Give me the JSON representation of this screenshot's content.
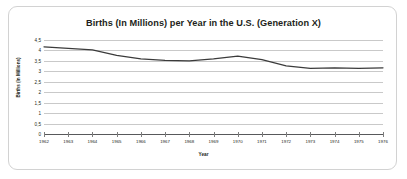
{
  "chart_data": {
    "type": "line",
    "title": "Births (In Millions) per Year in the U.S. (Generation X)",
    "xlabel": "Year",
    "ylabel": "Births (In Millions)",
    "categories": [
      1962,
      1963,
      1964,
      1965,
      1966,
      1967,
      1968,
      1969,
      1970,
      1971,
      1972,
      1973,
      1974,
      1975,
      1976
    ],
    "x_tick_labels": [
      "1962",
      "1963",
      "1964",
      "1965",
      "1966",
      "1967",
      "1968",
      "1969",
      "1970",
      "1971",
      "1972",
      "1973",
      "1974",
      "1975",
      "1976"
    ],
    "values": [
      4.17,
      4.1,
      4.03,
      3.76,
      3.6,
      3.52,
      3.5,
      3.6,
      3.73,
      3.56,
      3.26,
      3.14,
      3.16,
      3.14,
      3.17
    ],
    "y_tick_labels": [
      "4,5",
      "4",
      "3,5",
      "3",
      "2,5",
      "2",
      "1,5",
      "1",
      "0,5",
      "0"
    ],
    "y_tick_values": [
      4.5,
      4,
      3.5,
      3,
      2.5,
      2,
      1.5,
      1,
      0.5,
      0
    ],
    "ylim": [
      0,
      4.5
    ],
    "grid": true,
    "legend": "none",
    "line_color": "#3b3b3b",
    "grid_color": "#c9c9c9",
    "axis_color": "#58595b",
    "decimal_separator": ","
  }
}
